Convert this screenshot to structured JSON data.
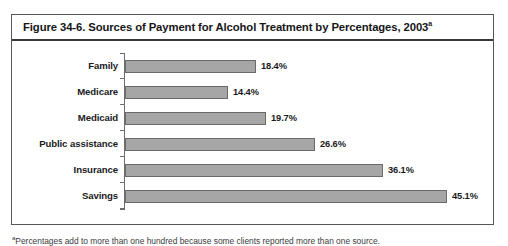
{
  "figure": {
    "title_prefix": "Figure 34-6. Sources of Payment for Alcohol Treatment by Percentages, 2003",
    "title_superscript": "a",
    "footnote_marker": "a",
    "footnote_text": "Percentages add to more than one hundred because some clients reported more than one source."
  },
  "colors": {
    "bar_fill": "#a6a6a6",
    "bar_border": "#6a6a6a",
    "frame": "#56565a",
    "text": "#1a1a1c"
  },
  "chart_data": {
    "type": "bar",
    "orientation": "horizontal",
    "title": "Figure 34-6. Sources of Payment for Alcohol Treatment by Percentages, 2003",
    "xlabel": "",
    "ylabel": "",
    "grid": false,
    "legend": false,
    "xlim": [
      0,
      47
    ],
    "categories": [
      "Family",
      "Medicare",
      "Medicaid",
      "Public assistance",
      "Insurance",
      "Savings"
    ],
    "values": [
      18.4,
      14.4,
      19.7,
      26.6,
      36.1,
      45.1
    ],
    "value_labels": [
      "18.4%",
      "14.4%",
      "19.7%",
      "26.6%",
      "36.1%",
      "45.1%"
    ],
    "unit": "%"
  }
}
